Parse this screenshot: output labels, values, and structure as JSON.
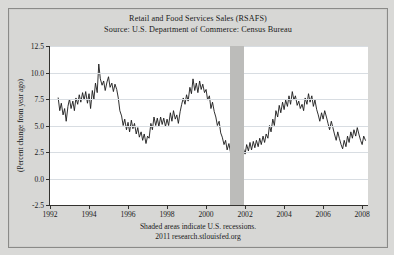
{
  "header": {
    "title": "Retail and Food Services Sales (RSAFS)",
    "source": "Source: U.S. Department of Commerce: Census Bureau"
  },
  "footer": {
    "line1": "Shaded areas indicate U.S. recessions.",
    "line2": "2011 research.stlouisfed.org"
  },
  "chart_data": {
    "type": "line",
    "title": "Retail and Food Services Sales (RSAFS)",
    "subtitle": "Source: U.S. Department of Commerce: Census Bureau",
    "xlabel": "",
    "ylabel": "(Percent change from year ago)",
    "xlim": [
      1992.0,
      2008.3
    ],
    "ylim": [
      -2.5,
      12.5
    ],
    "ytick_labels": [
      "12.5",
      "10.0",
      "7.5",
      "5.0",
      "2.5",
      "0.0",
      "-2.5"
    ],
    "yticks": [
      12.5,
      10.0,
      7.5,
      5.0,
      2.5,
      0.0,
      -2.5
    ],
    "xtick_labels": [
      "1992",
      "1994",
      "1996",
      "1998",
      "2000",
      "2002",
      "2004",
      "2006",
      "2008"
    ],
    "xticks": [
      1992,
      1994,
      1996,
      1998,
      2000,
      2002,
      2004,
      2006,
      2008
    ],
    "grid": "horizontal",
    "legend": "none",
    "line_color": "#1a1a1a",
    "recession_color": "#bcbcba",
    "recession_bands": [
      [
        2001.25,
        2001.92
      ]
    ],
    "series": [
      {
        "name": "Retail and Food Services Sales, percent change from year ago",
        "x": [
          1992.42,
          1992.5,
          1992.58,
          1992.67,
          1992.75,
          1992.83,
          1992.92,
          1993.0,
          1993.08,
          1993.17,
          1993.25,
          1993.33,
          1993.42,
          1993.5,
          1993.58,
          1993.67,
          1993.75,
          1993.83,
          1993.92,
          1994.0,
          1994.08,
          1994.17,
          1994.25,
          1994.33,
          1994.42,
          1994.5,
          1994.58,
          1994.67,
          1994.75,
          1994.83,
          1994.92,
          1995.0,
          1995.08,
          1995.17,
          1995.25,
          1995.33,
          1995.42,
          1995.5,
          1995.58,
          1995.67,
          1995.75,
          1995.83,
          1995.92,
          1996.0,
          1996.08,
          1996.17,
          1996.25,
          1996.33,
          1996.42,
          1996.5,
          1996.58,
          1996.67,
          1996.75,
          1996.83,
          1996.92,
          1997.0,
          1997.08,
          1997.17,
          1997.25,
          1997.33,
          1997.42,
          1997.5,
          1997.58,
          1997.67,
          1997.75,
          1997.83,
          1997.92,
          1998.0,
          1998.08,
          1998.17,
          1998.25,
          1998.33,
          1998.42,
          1998.5,
          1998.58,
          1998.67,
          1998.75,
          1998.83,
          1998.92,
          1999.0,
          1999.08,
          1999.17,
          1999.25,
          1999.33,
          1999.42,
          1999.5,
          1999.58,
          1999.67,
          1999.75,
          1999.83,
          1999.92,
          2000.0,
          2000.08,
          2000.17,
          2000.25,
          2000.33,
          2000.42,
          2000.5,
          2000.58,
          2000.67,
          2000.75,
          2000.83,
          2000.92,
          2001.0,
          2001.08,
          2001.17,
          2001.25,
          2001.33,
          2001.42,
          2001.5,
          2001.58,
          2001.67,
          2001.75,
          2001.83,
          2001.92,
          2002.0,
          2002.08,
          2002.17,
          2002.25,
          2002.33,
          2002.42,
          2002.5,
          2002.58,
          2002.67,
          2002.75,
          2002.83,
          2002.92,
          2003.0,
          2003.08,
          2003.17,
          2003.25,
          2003.33,
          2003.42,
          2003.5,
          2003.58,
          2003.67,
          2003.75,
          2003.83,
          2003.92,
          2004.0,
          2004.08,
          2004.17,
          2004.25,
          2004.33,
          2004.42,
          2004.5,
          2004.58,
          2004.67,
          2004.75,
          2004.83,
          2004.92,
          2005.0,
          2005.08,
          2005.17,
          2005.25,
          2005.33,
          2005.42,
          2005.5,
          2005.58,
          2005.67,
          2005.75,
          2005.83,
          2005.92,
          2006.0,
          2006.08,
          2006.17,
          2006.25,
          2006.33,
          2006.42,
          2006.5,
          2006.58,
          2006.67,
          2006.75,
          2006.83,
          2006.92,
          2007.0,
          2007.08,
          2007.17,
          2007.25,
          2007.33,
          2007.42,
          2007.5,
          2007.58,
          2007.67,
          2007.75,
          2007.83,
          2007.92,
          2008.0,
          2008.08,
          2008.17
        ],
        "values": [
          7.6,
          6.4,
          7.1,
          6.0,
          6.6,
          5.4,
          6.8,
          7.5,
          6.6,
          7.3,
          6.4,
          7.6,
          7.0,
          7.9,
          7.2,
          8.1,
          7.4,
          8.2,
          7.1,
          8.0,
          6.6,
          8.3,
          7.5,
          9.0,
          8.1,
          10.8,
          9.4,
          8.8,
          9.2,
          8.3,
          9.1,
          9.6,
          8.6,
          9.0,
          8.2,
          8.9,
          8.4,
          7.6,
          6.4,
          5.9,
          5.0,
          5.6,
          4.6,
          5.3,
          4.4,
          5.5,
          4.7,
          5.2,
          4.2,
          4.8,
          3.9,
          4.4,
          3.6,
          4.2,
          3.3,
          4.0,
          3.8,
          5.2,
          4.6,
          5.8,
          5.0,
          5.7,
          4.9,
          5.8,
          5.1,
          5.7,
          4.9,
          5.6,
          5.0,
          6.2,
          5.4,
          6.4,
          5.6,
          6.0,
          5.2,
          6.3,
          7.0,
          7.6,
          7.0,
          7.9,
          7.3,
          8.6,
          8.0,
          9.4,
          8.3,
          9.0,
          8.1,
          9.2,
          8.4,
          8.9,
          8.1,
          8.4,
          7.4,
          7.8,
          6.6,
          7.2,
          6.3,
          5.8,
          5.0,
          5.4,
          4.3,
          3.9,
          3.2,
          3.6,
          2.7,
          3.3,
          2.5,
          3.4,
          2.6,
          3.1,
          1.8,
          -0.6,
          -2.0,
          1.2,
          2.8,
          2.3,
          3.2,
          2.6,
          3.4,
          2.7,
          3.5,
          2.9,
          3.6,
          3.0,
          3.8,
          3.2,
          4.0,
          3.4,
          4.2,
          3.8,
          5.0,
          4.4,
          5.6,
          5.0,
          6.4,
          5.8,
          6.9,
          6.2,
          7.2,
          6.5,
          7.4,
          6.8,
          7.8,
          7.0,
          8.2,
          7.4,
          7.8,
          6.9,
          7.3,
          6.6,
          7.0,
          6.4,
          7.6,
          7.0,
          8.0,
          7.2,
          7.8,
          6.8,
          7.4,
          6.5,
          6.0,
          5.4,
          6.2,
          5.6,
          6.4,
          5.8,
          5.2,
          4.6,
          5.4,
          4.8,
          4.2,
          3.6,
          4.4,
          3.8,
          3.2,
          2.8,
          3.6,
          3.0,
          4.0,
          3.4,
          4.4,
          3.8,
          4.6,
          4.0,
          4.8,
          4.2,
          3.6,
          3.2,
          4.0,
          3.6
        ]
      }
    ]
  }
}
